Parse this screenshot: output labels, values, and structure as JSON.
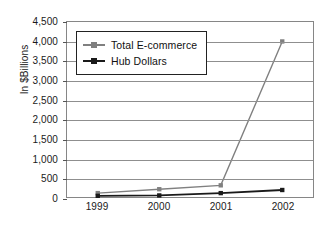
{
  "chart_data": {
    "type": "line",
    "title": "",
    "xlabel": "",
    "ylabel": "In $Billions",
    "categories": [
      "1999",
      "2000",
      "2001",
      "2002"
    ],
    "ylim": [
      0,
      4500
    ],
    "ytick_values": [
      0,
      500,
      1000,
      1500,
      2000,
      2500,
      3000,
      3500,
      4000,
      4500
    ],
    "ytick_labels": [
      "0",
      "500",
      "1,000",
      "1,500",
      "2,000",
      "2,500",
      "3,000",
      "3,500",
      "4,000",
      "4,500"
    ],
    "grid": true,
    "legend_position": "top-left-inside",
    "series": [
      {
        "name": "Total E-commerce",
        "values": [
          100,
          200,
          300,
          4000
        ],
        "color": "#808080",
        "marker": "square"
      },
      {
        "name": "Hub Dollars",
        "values": [
          30,
          40,
          100,
          180
        ],
        "color": "#1a1a1a",
        "marker": "square"
      }
    ]
  },
  "legend": {
    "items": [
      {
        "label": "Total E-commerce"
      },
      {
        "label": "Hub Dollars"
      }
    ]
  },
  "colors": {
    "series_ecommerce": "#808080",
    "series_hub": "#1a1a1a",
    "gridline": "#8f8f8f",
    "axis": "#868686",
    "text": "#1a1a1a",
    "background": "#ffffff"
  }
}
